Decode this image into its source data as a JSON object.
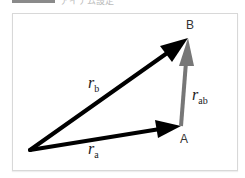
{
  "header": {
    "caption_fragment": "アイテム設定"
  },
  "diagram": {
    "points": {
      "origin": {
        "x": 30,
        "y": 150
      },
      "A": {
        "label": "A",
        "x": 181,
        "y": 126
      },
      "B": {
        "label": "B",
        "x": 188,
        "y": 38
      }
    },
    "vectors": [
      {
        "name": "r_a",
        "symbol": "r",
        "subscript": "a",
        "from": "origin",
        "to": "A",
        "color": "#000000"
      },
      {
        "name": "r_b",
        "symbol": "r",
        "subscript": "b",
        "from": "origin",
        "to": "B",
        "color": "#000000"
      },
      {
        "name": "r_ab",
        "symbol": "r",
        "subscript": "ab",
        "from": "A",
        "to": "B",
        "color": "#777777"
      }
    ]
  }
}
